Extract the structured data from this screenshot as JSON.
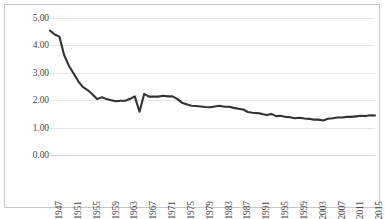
{
  "chart_data": {
    "type": "line",
    "title": "",
    "subtitle": "",
    "xlabel": "",
    "ylabel": "",
    "ylim": [
      0.0,
      5.0
    ],
    "ytick_labels": [
      "5.00",
      "4.00",
      "3.00",
      "2.00",
      "1.00",
      "0.00"
    ],
    "ytick_values": [
      5.0,
      4.0,
      3.0,
      2.0,
      1.0,
      0.0
    ],
    "xlim": [
      1947,
      2016
    ],
    "xtick_labels": [
      "1947",
      "1951",
      "1955",
      "1959",
      "1963",
      "1967",
      "1971",
      "1975",
      "1979",
      "1983",
      "1987",
      "1991",
      "1995",
      "1999",
      "2003",
      "2007",
      "2011",
      "2015"
    ],
    "xtick_values": [
      1947,
      1951,
      1955,
      1959,
      1963,
      1967,
      1971,
      1975,
      1979,
      1983,
      1987,
      1991,
      1995,
      1999,
      2003,
      2007,
      2011,
      2015
    ],
    "grid": true,
    "grid_axis": "y",
    "legend": false,
    "legend_position": "none",
    "line_color": "#333333",
    "line_width": 2.1,
    "markers": false,
    "x": [
      1947,
      1948,
      1949,
      1950,
      1951,
      1952,
      1953,
      1954,
      1955,
      1956,
      1957,
      1958,
      1959,
      1960,
      1961,
      1962,
      1963,
      1964,
      1965,
      1966,
      1967,
      1968,
      1969,
      1970,
      1971,
      1972,
      1973,
      1974,
      1975,
      1976,
      1977,
      1978,
      1979,
      1980,
      1981,
      1982,
      1983,
      1984,
      1985,
      1986,
      1987,
      1988,
      1989,
      1990,
      1991,
      1992,
      1993,
      1994,
      1995,
      1996,
      1997,
      1998,
      1999,
      2000,
      2001,
      2002,
      2003,
      2004,
      2005,
      2006,
      2007,
      2008,
      2009,
      2010,
      2011,
      2012,
      2013,
      2014,
      2015,
      2016
    ],
    "series": [
      {
        "name": "rate",
        "values": [
          4.54,
          4.4,
          4.32,
          3.65,
          3.26,
          2.98,
          2.69,
          2.48,
          2.37,
          2.22,
          2.04,
          2.11,
          2.04,
          2.0,
          1.96,
          1.98,
          1.98,
          2.05,
          2.14,
          1.58,
          2.23,
          2.13,
          2.13,
          2.13,
          2.16,
          2.14,
          2.14,
          2.05,
          1.91,
          1.85,
          1.8,
          1.79,
          1.77,
          1.75,
          1.74,
          1.77,
          1.8,
          1.76,
          1.76,
          1.72,
          1.69,
          1.66,
          1.57,
          1.54,
          1.53,
          1.5,
          1.46,
          1.5,
          1.42,
          1.43,
          1.39,
          1.38,
          1.34,
          1.36,
          1.33,
          1.32,
          1.29,
          1.29,
          1.26,
          1.32,
          1.34,
          1.37,
          1.37,
          1.39,
          1.39,
          1.41,
          1.43,
          1.42,
          1.45,
          1.44
        ]
      }
    ]
  }
}
